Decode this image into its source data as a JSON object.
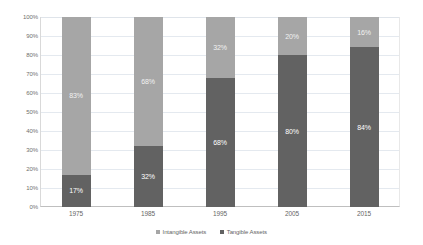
{
  "chart_data": {
    "type": "bar",
    "subtype": "stacked-100-percent",
    "title": "",
    "xlabel": "",
    "ylabel": "",
    "categories": [
      "1975",
      "1985",
      "1995",
      "2005",
      "2015"
    ],
    "series": [
      {
        "name": "Intangible Assets",
        "color": "#a6a6a6",
        "values": [
          83,
          68,
          32,
          20,
          16
        ],
        "labels": [
          "83%",
          "68%",
          "32%",
          "20%",
          "16%"
        ]
      },
      {
        "name": "Tangible Assets",
        "color": "#626262",
        "values": [
          17,
          32,
          68,
          80,
          84
        ],
        "labels": [
          "17%",
          "32%",
          "68%",
          "80%",
          "84%"
        ]
      }
    ],
    "ylim": [
      0,
      100
    ],
    "y_ticks": [
      0,
      10,
      20,
      30,
      40,
      50,
      60,
      70,
      80,
      90,
      100
    ],
    "y_tick_labels": [
      "0%",
      "10%",
      "20%",
      "30%",
      "40%",
      "50%",
      "60%",
      "70%",
      "80%",
      "90%",
      "100%"
    ],
    "grid": true,
    "grid_axis": "y",
    "legend_position": "bottom",
    "legend": [
      "Intangible Assets",
      "Tangible Assets"
    ]
  },
  "colors": {
    "intangible": "#a6a6a6",
    "tangible": "#626262",
    "gridline": "#e4e9ef",
    "axis": "#bfbfbf",
    "tick_text": "#6f6f6f",
    "label_text": "#ffffff",
    "background": "#ffffff"
  }
}
